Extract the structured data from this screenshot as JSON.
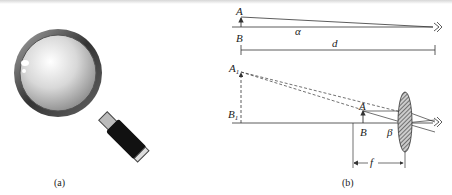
{
  "figure_a": {
    "caption": "(a)",
    "subject": "magnifying-glass"
  },
  "figure_b": {
    "caption": "(b)",
    "top_diagram": {
      "labels": {
        "A": "A",
        "B": "B",
        "alpha": "α",
        "d": "d"
      }
    },
    "bottom_diagram": {
      "labels": {
        "A1": "A",
        "A1_sub": "1",
        "B1": "B",
        "B1_sub": "1",
        "A": "A",
        "B": "B",
        "beta": "β",
        "f": "f"
      }
    }
  },
  "colors": {
    "line": "#333333",
    "lens_fill": "#888888"
  }
}
